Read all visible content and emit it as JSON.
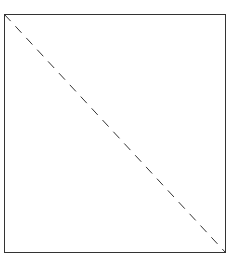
{
  "diagram": {
    "box": {
      "x": 4.5,
      "y": 14.5,
      "width": 221,
      "height": 238,
      "stroke": "#333333",
      "stroke_width": 1
    },
    "diagonal": {
      "x1": 4.5,
      "y1": 14.5,
      "x2": 225.5,
      "y2": 252.5,
      "stroke": "#333333",
      "stroke_width": 1,
      "dash": "9,7"
    }
  }
}
